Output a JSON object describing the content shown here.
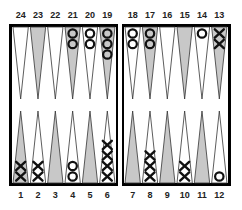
{
  "board": {
    "type": "backgammon",
    "colors": {
      "frame": "#000000",
      "light_point": "#ffffff",
      "dark_point": "#c8c8c8",
      "checker_stroke": "#111111"
    },
    "top_labels": [
      "24",
      "23",
      "22",
      "21",
      "20",
      "19",
      "18",
      "17",
      "16",
      "15",
      "14",
      "13"
    ],
    "bottom_labels": [
      "1",
      "2",
      "3",
      "4",
      "5",
      "6",
      "7",
      "8",
      "9",
      "10",
      "11",
      "12"
    ],
    "points": [
      {
        "point": 1,
        "shade": "dark",
        "checkers": "X",
        "count": 2
      },
      {
        "point": 2,
        "shade": "light",
        "checkers": "X",
        "count": 2
      },
      {
        "point": 3,
        "shade": "dark",
        "checkers": "",
        "count": 0
      },
      {
        "point": 4,
        "shade": "light",
        "checkers": "O",
        "count": 2
      },
      {
        "point": 5,
        "shade": "dark",
        "checkers": "",
        "count": 0
      },
      {
        "point": 6,
        "shade": "light",
        "checkers": "X",
        "count": 4
      },
      {
        "point": 7,
        "shade": "dark",
        "checkers": "",
        "count": 0
      },
      {
        "point": 8,
        "shade": "light",
        "checkers": "X",
        "count": 3
      },
      {
        "point": 9,
        "shade": "dark",
        "checkers": "",
        "count": 0
      },
      {
        "point": 10,
        "shade": "light",
        "checkers": "X",
        "count": 2
      },
      {
        "point": 11,
        "shade": "dark",
        "checkers": "",
        "count": 0
      },
      {
        "point": 12,
        "shade": "light",
        "checkers": "O",
        "count": 1
      },
      {
        "point": 13,
        "shade": "dark",
        "checkers": "X",
        "count": 2
      },
      {
        "point": 14,
        "shade": "light",
        "checkers": "O",
        "count": 1
      },
      {
        "point": 15,
        "shade": "dark",
        "checkers": "",
        "count": 0
      },
      {
        "point": 16,
        "shade": "light",
        "checkers": "",
        "count": 0
      },
      {
        "point": 17,
        "shade": "dark",
        "checkers": "O",
        "count": 2
      },
      {
        "point": 18,
        "shade": "light",
        "checkers": "O",
        "count": 2
      },
      {
        "point": 19,
        "shade": "dark",
        "checkers": "O",
        "count": 3
      },
      {
        "point": 20,
        "shade": "light",
        "checkers": "O",
        "count": 2
      },
      {
        "point": 21,
        "shade": "dark",
        "checkers": "O",
        "count": 2
      },
      {
        "point": 22,
        "shade": "light",
        "checkers": "",
        "count": 0
      },
      {
        "point": 23,
        "shade": "dark",
        "checkers": "",
        "count": 0
      },
      {
        "point": 24,
        "shade": "light",
        "checkers": "",
        "count": 0
      }
    ]
  }
}
